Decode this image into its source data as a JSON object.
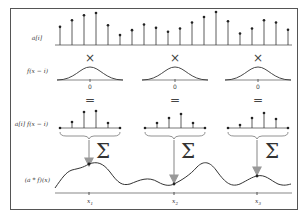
{
  "diagram": {
    "row_labels": {
      "signal": "a[i]",
      "kernel": "f(x − i)",
      "product": "a[i] f(x − i)",
      "result": "(a * f)(x)"
    },
    "operators": {
      "multiply": "×",
      "equals": "=",
      "sum": "Σ"
    },
    "kernel_center_label": "0",
    "sample_positions": [
      "x1",
      "x2",
      "x3"
    ],
    "sample_labels": [
      {
        "base": "x",
        "sub": "1"
      },
      {
        "base": "x",
        "sub": "2"
      },
      {
        "base": "x",
        "sub": "3"
      }
    ],
    "colors": {
      "stroke": "#333333",
      "arrow": "#999999",
      "frame": "#555555",
      "background": "#ffffff"
    }
  },
  "chart_data": {
    "type": "diagram",
    "signal_stems": [
      0.55,
      0.75,
      0.9,
      0.97,
      0.6,
      0.3,
      0.45,
      0.62,
      0.52,
      0.4,
      0.5,
      0.68,
      0.85,
      1.0,
      0.72,
      0.35,
      0.5,
      0.75,
      0.68,
      0.46
    ],
    "windows": [
      {
        "label": "x1",
        "products": [
          0.0,
          0.3,
          0.8,
          0.85,
          0.25,
          0.0
        ]
      },
      {
        "label": "x2",
        "products": [
          0.0,
          0.25,
          0.5,
          0.7,
          0.25,
          0.0
        ]
      },
      {
        "label": "x3",
        "products": [
          0.0,
          0.15,
          0.5,
          0.75,
          0.45,
          0.0
        ]
      }
    ]
  }
}
